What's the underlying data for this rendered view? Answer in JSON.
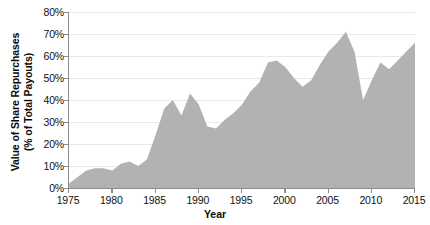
{
  "chart_data": {
    "type": "area",
    "title": "",
    "xlabel": "Year",
    "ylabel": "Value of Share Repurchases (% of Total Payouts)",
    "ylabel_line1": "Value of Share Repurchases",
    "ylabel_line2": "(% of Total Payouts)",
    "xlim": [
      1975,
      2015
    ],
    "ylim": [
      0,
      80
    ],
    "grid": true,
    "legend_position": "none",
    "series_name": "Value of Share Repurchases",
    "fill_color": "#b2b2b2",
    "gridline_color": "#e9e9e9",
    "axis_color": "#8c8c8c",
    "x_tick_labels": [
      "1975",
      "1980",
      "1985",
      "1990",
      "1995",
      "2000",
      "2005",
      "2010",
      "2015"
    ],
    "x_ticks": [
      1975,
      1980,
      1985,
      1990,
      1995,
      2000,
      2005,
      2010,
      2015
    ],
    "y_tick_labels": [
      "0%",
      "10%",
      "20%",
      "30%",
      "40%",
      "50%",
      "60%",
      "70%",
      "80%"
    ],
    "y_ticks": [
      0,
      10,
      20,
      30,
      40,
      50,
      60,
      70,
      80
    ],
    "x": [
      1975,
      1976,
      1977,
      1978,
      1979,
      1980,
      1981,
      1982,
      1983,
      1984,
      1985,
      1986,
      1987,
      1988,
      1989,
      1990,
      1991,
      1992,
      1993,
      1994,
      1995,
      1996,
      1997,
      1998,
      1999,
      2000,
      2001,
      2002,
      2003,
      2004,
      2005,
      2006,
      2007,
      2008,
      2009,
      2010,
      2011,
      2012,
      2013,
      2014,
      2015
    ],
    "values": [
      2,
      5,
      8,
      9,
      9,
      8,
      11,
      12,
      10,
      13,
      24,
      36,
      40,
      33,
      43,
      38,
      28,
      27,
      31,
      34,
      38,
      44,
      48,
      57,
      58,
      55,
      50,
      46,
      49,
      56,
      62,
      66,
      71,
      62,
      40,
      49,
      57,
      54,
      58,
      62,
      66
    ]
  }
}
